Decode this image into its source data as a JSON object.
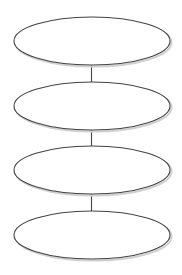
{
  "diagram": {
    "type": "vertical-flow",
    "background": "#ffffff",
    "stroke_color": "#444444",
    "shadow_color": "#d0d0d0",
    "fill_color": "#ffffff",
    "nodes": [
      {
        "id": "node-1",
        "label": "",
        "cx": 92,
        "cy": 41,
        "rx": 78,
        "ry": 24
      },
      {
        "id": "node-2",
        "label": "",
        "cx": 92,
        "cy": 106,
        "rx": 78,
        "ry": 24
      },
      {
        "id": "node-3",
        "label": "",
        "cx": 92,
        "cy": 170,
        "rx": 78,
        "ry": 24
      },
      {
        "id": "node-4",
        "label": "",
        "cx": 92,
        "cy": 235,
        "rx": 78,
        "ry": 24
      }
    ],
    "connectors": [
      {
        "from": "node-1",
        "to": "node-2"
      },
      {
        "from": "node-2",
        "to": "node-3"
      },
      {
        "from": "node-3",
        "to": "node-4"
      }
    ]
  }
}
